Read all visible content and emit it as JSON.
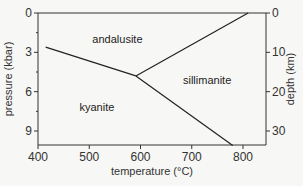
{
  "chart_data": {
    "type": "line",
    "title": "",
    "xlabel": "temperature (°C)",
    "ylabel": "pressure (kbar)",
    "y2label": "depth (km)",
    "xlim": [
      400,
      840
    ],
    "ylim": [
      10.1,
      0
    ],
    "y2lim": [
      33.6,
      0
    ],
    "xticks": [
      400,
      500,
      600,
      700,
      800
    ],
    "yticks": [
      0,
      3,
      6,
      9
    ],
    "yminor": [
      1.5,
      4.5,
      7.5
    ],
    "y2ticks": [
      0,
      10,
      20,
      30
    ],
    "grid": false,
    "series": [
      {
        "name": "kyanite-andalusite",
        "x": [
          415,
          591
        ],
        "y": [
          2.6,
          4.8
        ]
      },
      {
        "name": "andalusite-sillimanite",
        "x": [
          591,
          810
        ],
        "y": [
          4.8,
          0
        ]
      },
      {
        "name": "kyanite-sillimanite",
        "x": [
          591,
          780
        ],
        "y": [
          4.8,
          10.1
        ]
      }
    ],
    "annotations": [
      {
        "text": "andalusite",
        "x": 555,
        "y": 2.3
      },
      {
        "text": "sillimanite",
        "x": 730,
        "y": 5.4
      },
      {
        "text": "kyanite",
        "x": 515,
        "y": 7.5
      }
    ]
  }
}
